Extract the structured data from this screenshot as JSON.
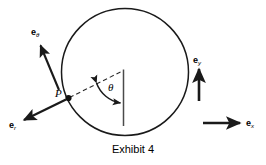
{
  "figure": {
    "caption": "Exhibit 4",
    "stroke_color": "#1a1a1a",
    "background_color": "#ffffff",
    "description_labels": {
      "point": "P",
      "angle": "θ"
    },
    "vectors": [
      {
        "id": "e-theta",
        "base": "e",
        "subscript": "θ",
        "direction": "up-left",
        "origin_label": "P"
      },
      {
        "id": "e-r",
        "base": "e",
        "subscript": "r",
        "direction": "down-left",
        "origin_label": "P"
      },
      {
        "id": "e-y",
        "base": "e",
        "subscript": "y",
        "direction": "up",
        "origin_label": ""
      },
      {
        "id": "e-x",
        "base": "e",
        "subscript": "x",
        "direction": "right",
        "origin_label": ""
      }
    ],
    "geometry": {
      "circle_center_x": 125,
      "circle_center_y": 72,
      "circle_radius": 64,
      "point_p_x": 68,
      "point_p_y": 98,
      "vertex_x": 124,
      "vertex_y": 70,
      "vertical_line_bottom_y": 126
    }
  }
}
